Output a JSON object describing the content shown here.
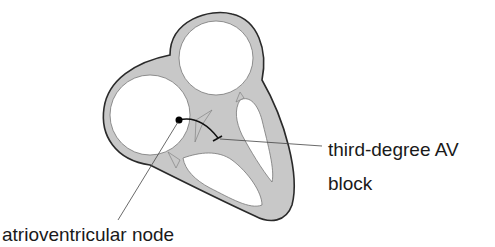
{
  "diagram": {
    "labels": {
      "block_line1": "third-degree AV",
      "block_line2": "block",
      "av_node": "atrioventricular node"
    },
    "colors": {
      "tissue_fill": "#c8c8c8",
      "outline": "#2a2a2a",
      "chamber_fill": "#ffffff",
      "leader_line": "#444444"
    }
  }
}
